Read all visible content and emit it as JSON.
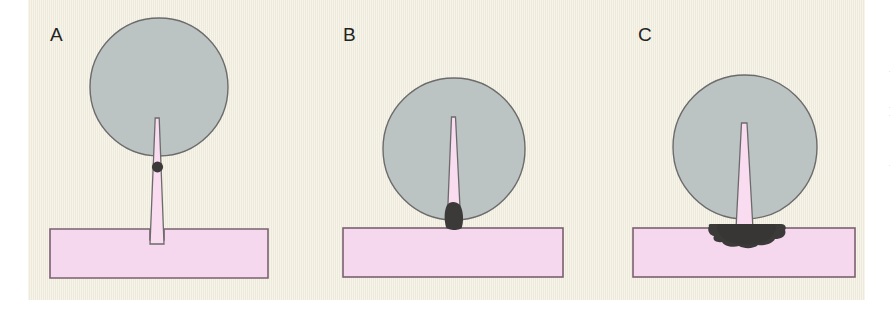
{
  "figure": {
    "kind": "scientific-line-diagram",
    "background_color": "#f4f1e3",
    "page_color": "#ffffff",
    "colors": {
      "cell_fill": "#bcc4c3",
      "cell_stroke": "#6b6b6b",
      "membrane_fill": "#f6d8ee",
      "membrane_stroke": "#7a6170",
      "needle_fill": "#f9dcf0",
      "needle_stroke": "#6b6b6b",
      "deposit_dark": "#3c3a39",
      "label_color": "#23231f"
    },
    "panels": [
      {
        "id": "A",
        "label": "A",
        "label_x": 50,
        "label_y": 24,
        "cell": {
          "cx": 159,
          "cy": 87,
          "r": 69
        },
        "needle": {
          "tip_x": 157,
          "tip_y": 118,
          "base_y": 229,
          "tip_w": 5,
          "base_w": 12
        },
        "deposit": {
          "shape": "small-round-dot",
          "cx": 157,
          "cy": 167,
          "rx": 5.5,
          "ry": 5.5
        },
        "membrane": {
          "x": 50,
          "y": 229,
          "w": 218,
          "h": 49,
          "notch": true
        }
      },
      {
        "id": "B",
        "label": "B",
        "label_x": 343,
        "label_y": 24,
        "cell": {
          "cx": 454,
          "cy": 149,
          "r": 71
        },
        "needle": {
          "tip_x": 453,
          "tip_y": 117,
          "base_y": 228,
          "tip_w": 4,
          "base_w": 13
        },
        "deposit": {
          "shape": "oblong-blob",
          "cx": 454,
          "cy": 219,
          "rx": 8,
          "ry": 14
        },
        "membrane": {
          "x": 343,
          "y": 228,
          "w": 220,
          "h": 49,
          "notch": false
        }
      },
      {
        "id": "C",
        "label": "C",
        "label_x": 638,
        "label_y": 24,
        "cell": {
          "cx": 745,
          "cy": 147,
          "r": 72
        },
        "needle": {
          "tip_x": 744,
          "tip_y": 123,
          "base_y": 228,
          "tip_w": 5,
          "base_w": 16
        },
        "deposit": {
          "shape": "large-irregular-splat",
          "cx": 746,
          "cy": 234,
          "rx": 39,
          "ry": 12
        },
        "membrane": {
          "x": 633,
          "y": 228,
          "w": 222,
          "h": 49,
          "notch": false
        }
      }
    ],
    "marginalia": [
      {
        "text": "·",
        "y": 68
      },
      {
        "text": "·",
        "y": 104
      },
      {
        "text": "·",
        "y": 112
      },
      {
        "text": "·",
        "y": 162
      }
    ]
  }
}
